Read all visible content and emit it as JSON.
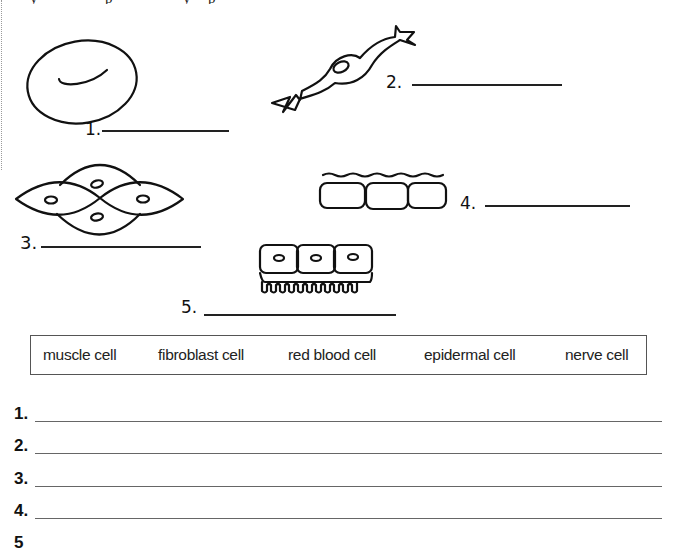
{
  "page": {
    "header_fragment": [
      "y",
      "p",
      "y",
      "p"
    ]
  },
  "diagrams": [
    {
      "number": "1.",
      "description": "red blood cell drawing (oval disc with central dimple)"
    },
    {
      "number": "2.",
      "description": "elongated spindle cell with branched ends and nucleus"
    },
    {
      "number": "3.",
      "description": "four overlapping lens-shaped cells with nuclei"
    },
    {
      "number": "4.",
      "description": "row of three rounded rectangular cells under a wavy surface line"
    },
    {
      "number": "5.",
      "description": "row of three cube cells with nuclei and microvilli fringe"
    }
  ],
  "diagram_labels": {
    "one": "1.",
    "two": "2.",
    "three": "3.",
    "four": "4.",
    "five": "5."
  },
  "word_bank": {
    "items": [
      "muscle cell",
      "fibroblast cell",
      "red blood cell",
      "epidermal cell",
      "nerve cell"
    ]
  },
  "answers": {
    "items": [
      {
        "number": "1.",
        "value": ""
      },
      {
        "number": "2.",
        "value": ""
      },
      {
        "number": "3.",
        "value": ""
      },
      {
        "number": "4.",
        "value": ""
      },
      {
        "number": "5",
        "value": ""
      }
    ]
  }
}
